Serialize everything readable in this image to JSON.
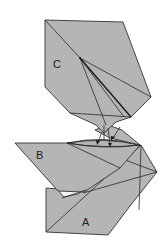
{
  "diagram": {
    "type": "origami-folding-step",
    "colors": {
      "paper": "#b5b5b5",
      "paper_inner": "#f4f4f4",
      "lines": "#333333",
      "background": "#ffffff"
    },
    "labels": {
      "flap_a": "A",
      "flap_b": "B",
      "flap_c": "C"
    },
    "parts": [
      {
        "id": "C",
        "position": "top",
        "description": "upper flap with radiating creases converging at a point"
      },
      {
        "id": "B",
        "position": "middle-left",
        "description": "left-pointing triangular flap"
      },
      {
        "id": "A",
        "position": "bottom",
        "description": "lower base flap"
      }
    ],
    "arrows": {
      "count": 3,
      "direction": "down",
      "meaning": "fold flaps downward into center"
    }
  }
}
